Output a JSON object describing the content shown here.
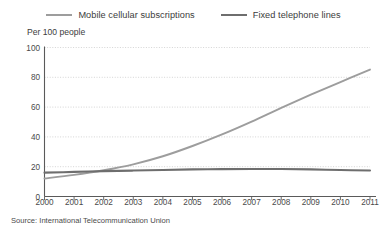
{
  "chart_data": {
    "type": "line",
    "title": "",
    "subtitle": "",
    "unit_label": "Per 100 people",
    "xlabel": "",
    "ylabel": "Per 100 people",
    "source": "Source: International Telecommunication Union",
    "grid": true,
    "legend_position": "top",
    "xlim": [
      2000,
      2011
    ],
    "ylim": [
      0,
      100
    ],
    "yticks": [
      0,
      20,
      40,
      60,
      80,
      100
    ],
    "ytick_labels": [
      "0",
      "20",
      "40",
      "60",
      "80",
      "100"
    ],
    "x": [
      2000,
      2001,
      2002,
      2003,
      2004,
      2005,
      2006,
      2007,
      2008,
      2009,
      2010,
      2011
    ],
    "xtick_labels": [
      "2000",
      "2001",
      "2002",
      "2003",
      "2004",
      "2005",
      "2006",
      "2007",
      "2008",
      "2009",
      "2010",
      "2011"
    ],
    "series": [
      {
        "name": "Mobile cellular subscriptions",
        "color": "#9d9d9d",
        "values": [
          12.1,
          14.5,
          17.6,
          21.6,
          27.0,
          33.9,
          41.7,
          50.3,
          59.5,
          68.3,
          76.8,
          85.2
        ]
      },
      {
        "name": "Fixed telephone lines",
        "color": "#6e6e6e",
        "values": [
          16.0,
          16.5,
          17.0,
          17.4,
          17.8,
          18.2,
          18.4,
          18.5,
          18.5,
          18.2,
          17.8,
          17.4
        ]
      }
    ]
  },
  "legend": {
    "items": [
      {
        "label": "Mobile cellular subscriptions"
      },
      {
        "label": "Fixed telephone lines"
      }
    ]
  },
  "colors": {
    "mobile": "#9d9d9d",
    "fixed": "#6e6e6e",
    "axis": "#5a5a5a",
    "grid": "#c9c9c9",
    "text": "#3c3c3c",
    "background": "#ffffff"
  }
}
